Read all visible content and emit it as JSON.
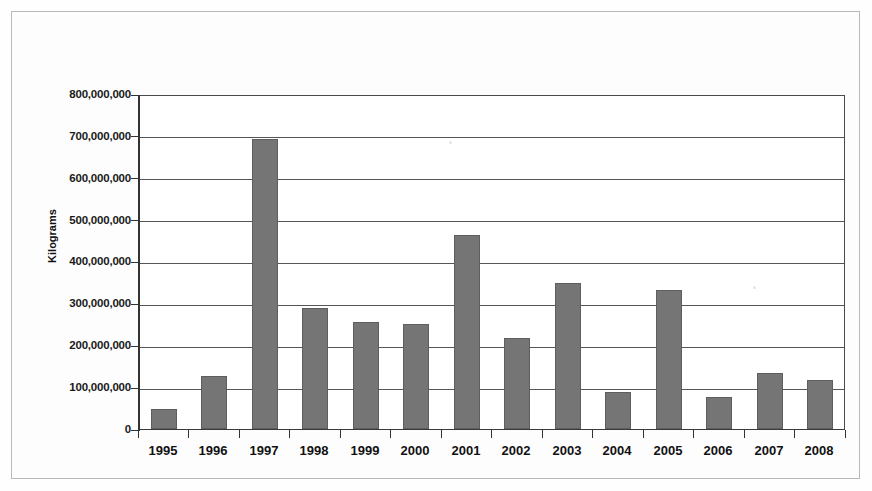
{
  "chart_data": {
    "type": "bar",
    "title": "",
    "subtitle": "",
    "xlabel": "",
    "ylabel": "Kilograms",
    "categories": [
      "1995",
      "1996",
      "1997",
      "1998",
      "1999",
      "2000",
      "2001",
      "2002",
      "2003",
      "2004",
      "2005",
      "2006",
      "2007",
      "2008"
    ],
    "values": [
      48000000,
      128000000,
      698000000,
      290000000,
      258000000,
      252000000,
      465000000,
      219000000,
      350000000,
      90000000,
      333000000,
      78000000,
      135000000,
      118000000
    ],
    "ylim": [
      0,
      800000000
    ],
    "y_ticks": [
      0,
      100000000,
      200000000,
      300000000,
      400000000,
      500000000,
      600000000,
      700000000,
      800000000
    ],
    "y_tick_labels": [
      "0",
      "100,000,000",
      "200,000,000",
      "300,000,000",
      "400,000,000",
      "500,000,000",
      "600,000,000",
      "700,000,000",
      "800,000,000"
    ],
    "grid": true,
    "legend": false,
    "legend_position": "none",
    "series": [
      {
        "name": "Kilograms",
        "color": "#757575",
        "values": [
          48000000,
          128000000,
          698000000,
          290000000,
          258000000,
          252000000,
          465000000,
          219000000,
          350000000,
          90000000,
          333000000,
          78000000,
          135000000,
          118000000
        ]
      }
    ]
  },
  "colors": {
    "bar_fill": "#757575",
    "bar_border": "#5e5e5e",
    "axis": "#333333",
    "gridline": "#555555",
    "frame": "#b9b9b9",
    "background": "#fefefe",
    "text": "#111111"
  }
}
